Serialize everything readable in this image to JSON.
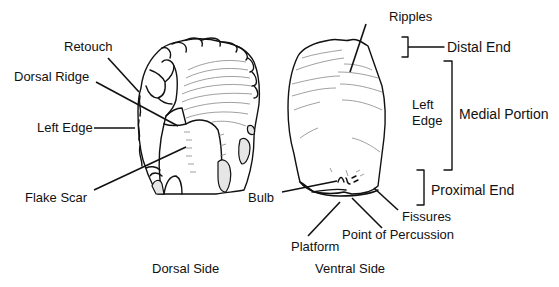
{
  "diagram": {
    "dorsal": {
      "caption": "Dorsal Side",
      "labels": {
        "retouch": "Retouch",
        "dorsal_ridge": "Dorsal Ridge",
        "left_edge": "Left Edge",
        "flake_scar": "Flake Scar"
      }
    },
    "ventral": {
      "caption": "Ventral Side",
      "labels": {
        "ripples": "Ripples",
        "left_edge_line1": "Left",
        "left_edge_line2": "Edge",
        "bulb": "Bulb",
        "fissures": "Fissures",
        "point_of_percussion": "Point of Percussion",
        "platform": "Platform"
      }
    },
    "regions": {
      "distal_end": "Distal End",
      "medial_portion": "Medial Portion",
      "proximal_end": "Proximal End"
    },
    "colors": {
      "line": "#111111",
      "background": "#ffffff",
      "ripple": "#888888"
    }
  }
}
